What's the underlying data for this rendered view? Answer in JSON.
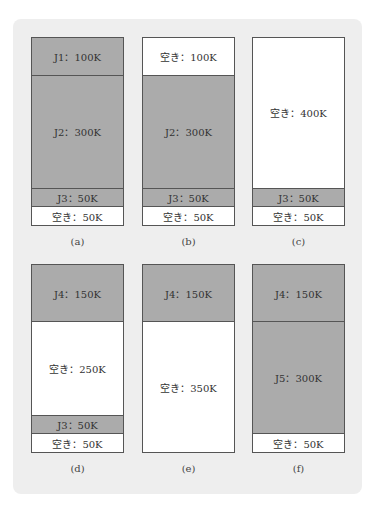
{
  "figure": {
    "unit_total_k": 500,
    "colors": {
      "job": "#ababab",
      "free": "#ffffff",
      "background": "#eeeeee",
      "border": "#555555"
    },
    "panels": [
      {
        "caption": "(a)",
        "segments": [
          {
            "label": "J1：100K",
            "kind": "job",
            "size_k": 100
          },
          {
            "label": "J2：300K",
            "kind": "job",
            "size_k": 300
          },
          {
            "label": "J3：50K",
            "kind": "job",
            "size_k": 50
          },
          {
            "label": "空き：50K",
            "kind": "free",
            "size_k": 50
          }
        ]
      },
      {
        "caption": "(b)",
        "segments": [
          {
            "label": "空き：100K",
            "kind": "free",
            "size_k": 100
          },
          {
            "label": "J2：300K",
            "kind": "job",
            "size_k": 300
          },
          {
            "label": "J3：50K",
            "kind": "job",
            "size_k": 50
          },
          {
            "label": "空き：50K",
            "kind": "free",
            "size_k": 50
          }
        ]
      },
      {
        "caption": "(c)",
        "segments": [
          {
            "label": "空き：400K",
            "kind": "free",
            "size_k": 400
          },
          {
            "label": "J3：50K",
            "kind": "job",
            "size_k": 50
          },
          {
            "label": "空き：50K",
            "kind": "free",
            "size_k": 50
          }
        ]
      },
      {
        "caption": "(d)",
        "segments": [
          {
            "label": "J4：150K",
            "kind": "job",
            "size_k": 150
          },
          {
            "label": "空き：250K",
            "kind": "free",
            "size_k": 250
          },
          {
            "label": "J3：50K",
            "kind": "job",
            "size_k": 50
          },
          {
            "label": "空き：50K",
            "kind": "free",
            "size_k": 50
          }
        ]
      },
      {
        "caption": "(e)",
        "segments": [
          {
            "label": "J4：150K",
            "kind": "job",
            "size_k": 150
          },
          {
            "label": "空き：350K",
            "kind": "free",
            "size_k": 350
          }
        ]
      },
      {
        "caption": "(f)",
        "segments": [
          {
            "label": "J4：150K",
            "kind": "job",
            "size_k": 150
          },
          {
            "label": "J5：300K",
            "kind": "job",
            "size_k": 300
          },
          {
            "label": "空き：50K",
            "kind": "free",
            "size_k": 50
          }
        ]
      }
    ]
  }
}
